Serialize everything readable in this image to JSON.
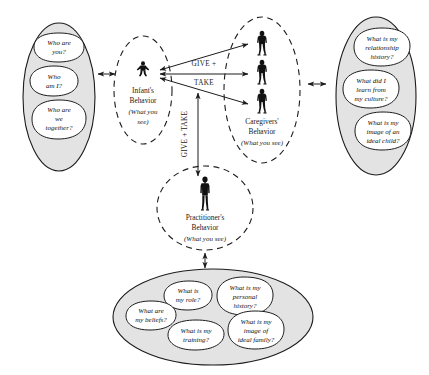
{
  "diagram": {
    "colors": {
      "oval_fill": "#e3e3e3",
      "bubble_fill": "#ffffff",
      "stroke": "#1c1c1c",
      "figure": "#111111",
      "background": "#ffffff"
    }
  },
  "left_oval": {
    "name": "infant-questions-oval",
    "bubbles": [
      {
        "lines": [
          "Who are",
          "you?"
        ]
      },
      {
        "lines": [
          "Who",
          "am I?"
        ]
      },
      {
        "lines": [
          "Who are",
          "we",
          "together?"
        ]
      }
    ]
  },
  "infant_node": {
    "name": "infants-behavior-node",
    "title_lines": [
      "Infant's",
      "Behavior"
    ],
    "subtitle_lines": [
      "(What you",
      "see)"
    ],
    "figure_count": 1,
    "figure_type": "infant-figure"
  },
  "caregivers_node": {
    "name": "caregivers-behavior-node",
    "title_lines": [
      "Caregivers'",
      "Behavior"
    ],
    "subtitle_lines": [
      "(What you see)"
    ],
    "figure_count": 3,
    "figure_type": "adult-figure"
  },
  "practitioner_node": {
    "name": "practitioners-behavior-node",
    "title_lines": [
      "Practitioner's",
      "Behavior"
    ],
    "subtitle_lines": [
      "(What you see)"
    ],
    "figure_count": 1,
    "figure_type": "practitioner-figure"
  },
  "right_oval": {
    "name": "caregiver-questions-oval",
    "bubbles": [
      {
        "lines": [
          "What is my",
          "relationship",
          "history?"
        ]
      },
      {
        "lines": [
          "What did I",
          "learn from",
          "my culture?"
        ]
      },
      {
        "lines": [
          "What is my",
          "image of an",
          "ideal child?"
        ]
      }
    ]
  },
  "bottom_oval": {
    "name": "practitioner-questions-oval",
    "bubbles": [
      {
        "lines": [
          "What is",
          "my role?"
        ]
      },
      {
        "lines": [
          "What is my",
          "personal",
          "history?"
        ]
      },
      {
        "lines": [
          "What are",
          "my beliefs?"
        ]
      },
      {
        "lines": [
          "What is my",
          "training?"
        ]
      },
      {
        "lines": [
          "What is my",
          "image of",
          "ideal family?"
        ]
      }
    ]
  },
  "flows": {
    "horizontal": {
      "name": "give-take-horizontal",
      "lines": [
        "GIVE +",
        "TAKE"
      ]
    },
    "vertical": {
      "name": "give-take-vertical",
      "text": "GIVE + TAKE"
    }
  },
  "connectors": [
    {
      "name": "connector-left-oval-to-infant"
    },
    {
      "name": "connector-caregivers-to-right-oval"
    },
    {
      "name": "connector-practitioner-to-bottom-oval"
    }
  ]
}
